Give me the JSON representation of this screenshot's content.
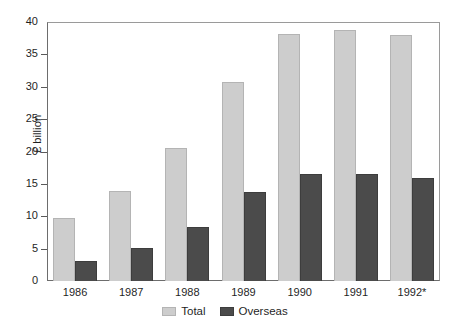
{
  "chart_data": {
    "type": "bar",
    "title": "",
    "xlabel": "",
    "ylabel": "£ billion",
    "ylim": [
      0,
      40
    ],
    "yticks": [
      0,
      5,
      10,
      15,
      20,
      25,
      30,
      35,
      40
    ],
    "ytick_labels": [
      "0",
      "5",
      "10",
      "15",
      "20",
      "25",
      "30",
      "35",
      "40"
    ],
    "grid": false,
    "legend_position": "bottom-center",
    "categories": [
      "1986",
      "1987",
      "1988",
      "1989",
      "1990",
      "1991",
      "1992*"
    ],
    "series": [
      {
        "name": "Total",
        "color": "#cdcdcd",
        "values": [
          9.7,
          13.9,
          20.6,
          30.7,
          38.2,
          38.8,
          38.0
        ]
      },
      {
        "name": "Overseas",
        "color": "#4b4b4b",
        "values": [
          3.1,
          5.1,
          8.4,
          13.8,
          16.5,
          16.5,
          15.9
        ]
      }
    ],
    "annotations": []
  },
  "legend": {
    "items": [
      {
        "label": "Total",
        "swatch": "total"
      },
      {
        "label": "Overseas",
        "swatch": "overseas"
      }
    ]
  },
  "colors": {
    "total": "#cdcdcd",
    "overseas": "#4b4b4b",
    "axis": "#5a5a5a",
    "text": "#1f1f1f",
    "background": "#ffffff"
  }
}
